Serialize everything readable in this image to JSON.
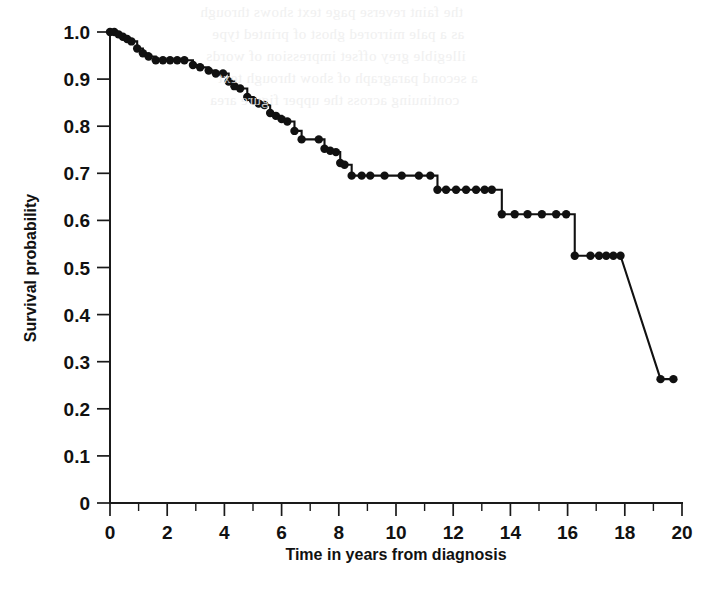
{
  "figure": {
    "background_color": "#ffffff",
    "ink_color": "#111111",
    "has_title": false,
    "title": "",
    "page_bleed_note": "faint mirrored show-through text from reverse page"
  },
  "chart_data": {
    "type": "line",
    "subtype": "kaplan-meier-survival-step",
    "title": "",
    "subtitle": "",
    "xlabel": "Time in years from diagnosis",
    "ylabel": "Survival probability",
    "xlim": [
      0,
      20
    ],
    "ylim": [
      0,
      1.0
    ],
    "grid": false,
    "legend": false,
    "legend_position": "none",
    "x_major_ticks": [
      0,
      2,
      4,
      6,
      8,
      10,
      12,
      14,
      16,
      18,
      20
    ],
    "x_tick_labels": [
      "0",
      "2",
      "4",
      "6",
      "8",
      "10",
      "12",
      "14",
      "16",
      "18",
      "20"
    ],
    "x_minor_ticks": [
      1,
      3,
      5,
      7,
      9,
      11,
      13,
      15,
      17,
      19
    ],
    "y_major_ticks": [
      0,
      0.1,
      0.2,
      0.3,
      0.4,
      0.5,
      0.6,
      0.7,
      0.8,
      0.9,
      1.0
    ],
    "y_tick_labels": [
      "0",
      "0.1",
      "0.2",
      "0.3",
      "0.4",
      "0.5",
      "0.6",
      "0.7",
      "0.8",
      "0.9",
      "1.0"
    ],
    "series": [
      {
        "name": "Survival probability",
        "line_color": "#111111",
        "marker": "filled-circle",
        "marker_color": "#111111",
        "x": [
          0.0,
          0.15,
          0.3,
          0.45,
          0.6,
          0.75,
          0.95,
          1.15,
          1.35,
          1.6,
          1.85,
          2.1,
          2.35,
          2.6,
          2.9,
          3.15,
          3.45,
          3.7,
          3.95,
          4.15,
          4.35,
          4.55,
          4.8,
          5.0,
          5.2,
          5.4,
          5.6,
          5.8,
          6.0,
          6.2,
          6.45,
          6.7,
          7.3,
          7.5,
          7.7,
          7.9,
          8.05,
          8.2,
          8.45,
          8.8,
          9.1,
          9.6,
          10.2,
          10.8,
          11.2,
          11.45,
          11.75,
          12.1,
          12.45,
          12.8,
          13.1,
          13.35,
          13.7,
          14.15,
          14.6,
          15.1,
          15.6,
          15.95,
          16.25,
          16.8,
          17.1,
          17.35,
          17.6,
          17.85,
          19.25,
          19.7
        ],
        "y": [
          1.0,
          1.0,
          0.995,
          0.99,
          0.985,
          0.98,
          0.965,
          0.955,
          0.948,
          0.94,
          0.94,
          0.94,
          0.94,
          0.94,
          0.93,
          0.925,
          0.918,
          0.912,
          0.912,
          0.895,
          0.885,
          0.88,
          0.862,
          0.855,
          0.848,
          0.845,
          0.828,
          0.822,
          0.815,
          0.81,
          0.79,
          0.772,
          0.772,
          0.752,
          0.748,
          0.745,
          0.722,
          0.718,
          0.695,
          0.695,
          0.695,
          0.695,
          0.695,
          0.695,
          0.695,
          0.665,
          0.665,
          0.665,
          0.665,
          0.665,
          0.665,
          0.665,
          0.613,
          0.613,
          0.613,
          0.613,
          0.613,
          0.613,
          0.525,
          0.525,
          0.525,
          0.525,
          0.525,
          0.525,
          0.263,
          0.263
        ],
        "n_marks": 65,
        "start_value": 1.0,
        "end_value": 0.263
      }
    ],
    "annotations": [],
    "notable_plateaus": [
      {
        "value": 0.695,
        "from_x": 8.45,
        "to_x": 11.2
      },
      {
        "value": 0.665,
        "from_x": 11.45,
        "to_x": 13.35
      },
      {
        "value": 0.613,
        "from_x": 13.7,
        "to_x": 15.95
      },
      {
        "value": 0.525,
        "from_x": 16.25,
        "to_x": 17.85
      },
      {
        "value": 0.263,
        "from_x": 19.25,
        "to_x": 19.7
      }
    ]
  },
  "bleed_text": {
    "lines": [
      "the faint reverse page text shows through",
      "as a pale mirrored ghost of printed type",
      "illegible grey offset impression of words",
      "a second paragraph of show through text",
      "continuing across the upper figure area"
    ]
  }
}
